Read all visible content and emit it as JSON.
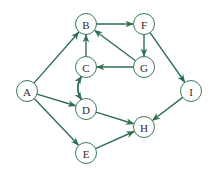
{
  "diagram": {
    "type": "directed-graph",
    "colors": {
      "edge": "#2f6e4f",
      "node_stroke": "#3c7a5a",
      "label": "#2a2a2a"
    },
    "nodes": [
      {
        "id": "A",
        "label": "A",
        "x": 27,
        "y": 91
      },
      {
        "id": "B",
        "label": "B",
        "x": 86,
        "y": 24
      },
      {
        "id": "F",
        "label": "F",
        "x": 144,
        "y": 24
      },
      {
        "id": "C",
        "label": "C",
        "x": 86,
        "y": 67
      },
      {
        "id": "G",
        "label": "G",
        "x": 144,
        "y": 67
      },
      {
        "id": "D",
        "label": "D",
        "x": 86,
        "y": 109
      },
      {
        "id": "I",
        "label": "I",
        "x": 191,
        "y": 91
      },
      {
        "id": "H",
        "label": "H",
        "x": 144,
        "y": 127
      },
      {
        "id": "E",
        "label": "E",
        "x": 86,
        "y": 153
      }
    ],
    "edges": [
      {
        "from": "A",
        "to": "B"
      },
      {
        "from": "A",
        "to": "D"
      },
      {
        "from": "A",
        "to": "E"
      },
      {
        "from": "B",
        "to": "F"
      },
      {
        "from": "F",
        "to": "G"
      },
      {
        "from": "F",
        "to": "I"
      },
      {
        "from": "G",
        "to": "B"
      },
      {
        "from": "G",
        "to": "C"
      },
      {
        "from": "C",
        "to": "B"
      },
      {
        "from": "C",
        "to": "D",
        "curve": "right"
      },
      {
        "from": "D",
        "to": "C",
        "curve": "left"
      },
      {
        "from": "D",
        "to": "H"
      },
      {
        "from": "E",
        "to": "H"
      },
      {
        "from": "I",
        "to": "H"
      }
    ]
  }
}
